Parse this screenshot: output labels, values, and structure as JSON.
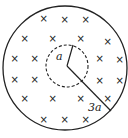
{
  "diagram": {
    "outer_circle": {
      "cx": 65,
      "cy": 68,
      "r": 63,
      "stroke": "#222"
    },
    "inner_circle": {
      "cx": 67,
      "cy": 66,
      "r": 21,
      "stroke": "#222",
      "dashed": true
    },
    "inner_radius_label": "a",
    "outer_radius_label": "3a",
    "field_symbol": "×",
    "field_marks": [
      [
        43,
        18
      ],
      [
        64,
        19
      ],
      [
        85,
        19
      ],
      [
        24,
        38
      ],
      [
        52,
        38
      ],
      [
        80,
        38
      ],
      [
        107,
        41
      ],
      [
        14,
        58
      ],
      [
        34,
        58
      ],
      [
        99,
        58
      ],
      [
        119,
        59
      ],
      [
        14,
        79
      ],
      [
        34,
        79
      ],
      [
        99,
        80
      ],
      [
        119,
        80
      ],
      [
        24,
        98
      ],
      [
        52,
        98
      ],
      [
        80,
        98
      ],
      [
        107,
        98
      ],
      [
        43,
        119
      ],
      [
        64,
        119
      ],
      [
        85,
        119
      ]
    ]
  }
}
